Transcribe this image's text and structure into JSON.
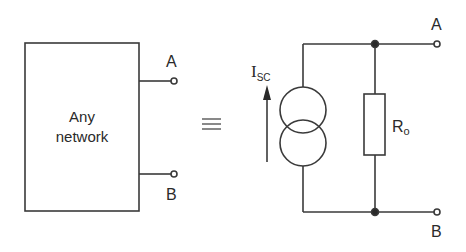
{
  "left_network": {
    "label_line1": "Any",
    "label_line2": "network",
    "terminal_a": "A",
    "terminal_b": "B"
  },
  "equivalence_symbol": "≡",
  "norton_equivalent": {
    "current_source_label": "I",
    "current_source_subscript": "SC",
    "resistor_label": "R",
    "resistor_subscript": "o",
    "terminal_a": "A",
    "terminal_b": "B"
  },
  "colors": {
    "stroke": "#3a3a3a",
    "background": "#ffffff"
  }
}
